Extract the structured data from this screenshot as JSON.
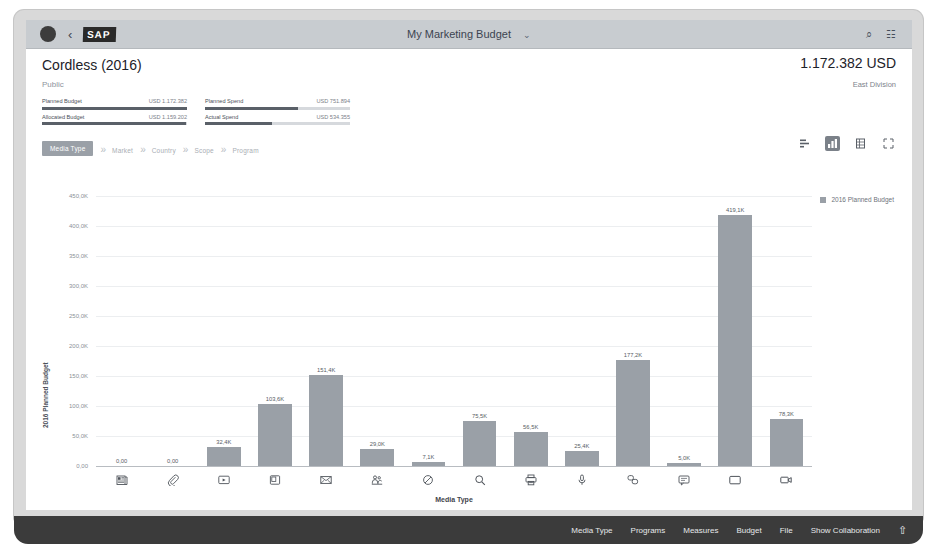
{
  "shell": {
    "avatar": "user-avatar",
    "back_label": "‹",
    "brand": "SAP",
    "title": "My Marketing Budget",
    "title_chevron": "⌄",
    "search_icon": "⌕",
    "menu_icon": "☷"
  },
  "page": {
    "title": "Cordless (2016)",
    "subtitle": "Public",
    "kpi_value": "1.172.382 USD",
    "kpi_sub": "East Division"
  },
  "budget": {
    "rows": [
      {
        "label": "Planned Budget",
        "value": "USD 1.172.382",
        "pct": 100
      },
      {
        "label": "Allocated Budget",
        "value": "USD 1.159.202",
        "pct": 99
      },
      {
        "label": "Planned Spend",
        "value": "USD 751.894",
        "pct": 64
      },
      {
        "label": "Actual Spend",
        "value": "USD 534.355",
        "pct": 46
      }
    ]
  },
  "drill": {
    "active": "Media Type",
    "separator": "»",
    "items": [
      "Market",
      "Country",
      "Scope",
      "Program"
    ]
  },
  "chart_tools": [
    {
      "name": "bar-chart-horizontal-icon",
      "glyph": "≣",
      "active": false
    },
    {
      "name": "column-chart-icon",
      "glyph": "█",
      "active": true
    },
    {
      "name": "table-view-icon",
      "glyph": "☷",
      "active": false
    },
    {
      "name": "fullscreen-icon",
      "glyph": "⛶",
      "active": false
    }
  ],
  "chart_data": {
    "type": "bar",
    "title": "",
    "legend": [
      "2016 Planned Budget"
    ],
    "legend_position": "top-right",
    "xlabel": "Media Type",
    "ylabel": "2016 Planned Budget",
    "ylim": [
      0,
      450000
    ],
    "grid": true,
    "ytick_labels": [
      "450,0K",
      "400,0K",
      "350,0K",
      "300,0K",
      "250,0K",
      "200,0K",
      "150,0K",
      "100,0K",
      "50,0K",
      "0,00"
    ],
    "ytick_values": [
      450000,
      400000,
      350000,
      300000,
      250000,
      200000,
      150000,
      100000,
      50000,
      0
    ],
    "categories": [
      "Print Advertising",
      "Affiliate",
      "Display Advertising",
      "Online Advertising",
      "Email",
      "Events",
      "Radio",
      "Search Engine",
      "Print",
      "Podcast",
      "Social Media",
      "SMS",
      "Television",
      "Video"
    ],
    "category_icons": [
      "newspaper-icon",
      "paperclip-icon",
      "display-ad-icon",
      "laptop-icon",
      "envelope-icon",
      "people-event-icon",
      "no-entry-radio-icon",
      "magnifier-icon",
      "printer-icon",
      "microphone-icon",
      "social-share-icon",
      "chat-bubble-icon",
      "television-icon",
      "video-camera-icon"
    ],
    "values": [
      0,
      0,
      32400,
      103600,
      151400,
      29000,
      7100,
      75500,
      56500,
      25400,
      177200,
      5000,
      419100,
      78300
    ],
    "value_labels": [
      "0,00",
      "0,00",
      "32,4K",
      "103,6K",
      "151,4K",
      "29,0K",
      "7,1K",
      "75,5K",
      "56,5K",
      "25,4K",
      "177,2K",
      "5,0K",
      "419,1K",
      "78,3K"
    ]
  },
  "footer": {
    "items": [
      "Media Type",
      "Programs",
      "Measures",
      "Budget",
      "File",
      "Show Collaboration"
    ],
    "share_icon": "⇧"
  }
}
